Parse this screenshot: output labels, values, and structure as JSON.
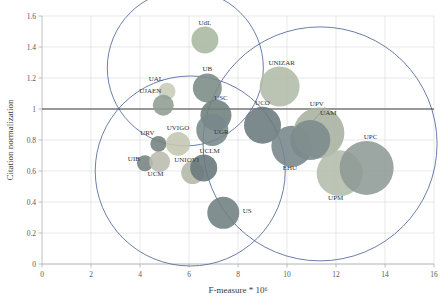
{
  "chart_data": {
    "type": "scatter",
    "title": "",
    "xlabel": "F-measure * 10⁶",
    "ylabel": "Citation normalization",
    "xlim": [
      0,
      16
    ],
    "ylim": [
      0,
      1.6
    ],
    "xticks": [
      0,
      2,
      4,
      6,
      8,
      10,
      12,
      14,
      16
    ],
    "yticks": [
      0,
      0.2,
      0.4,
      0.6,
      0.8,
      1,
      1.2,
      1.4,
      1.6
    ],
    "xtick_labels": [
      "0",
      "2",
      "4",
      "6",
      "8",
      "10",
      "12",
      "14",
      "16"
    ],
    "ytick_labels": [
      "0",
      "0.2",
      "0.4",
      "0.6",
      "0.8",
      "1",
      "1.2",
      "1.4",
      "1.6"
    ],
    "grid": true,
    "legend": "none",
    "reference_line": {
      "axis": "y",
      "value": 1.0,
      "color": "#3f3f3f"
    },
    "bubbles": [
      {
        "label": "UdL",
        "x": 6.65,
        "y": 1.445,
        "r": 13.5,
        "color": "#a9b7a0"
      },
      {
        "label": "UAL",
        "x": 5.1,
        "y": 1.115,
        "r": 8.5,
        "color": "#c8cbb8"
      },
      {
        "label": "UJAEN",
        "x": 4.95,
        "y": 1.025,
        "r": 10.5,
        "color": "#8f9d92"
      },
      {
        "label": "UB",
        "x": 6.75,
        "y": 1.135,
        "r": 14.5,
        "color": "#7b8b86"
      },
      {
        "label": "USC",
        "x": 7.1,
        "y": 0.96,
        "r": 15.5,
        "color": "#6f7f7c"
      },
      {
        "label": "UGR",
        "x": 6.95,
        "y": 0.865,
        "r": 16.0,
        "color": "#78878a"
      },
      {
        "label": "URV",
        "x": 4.75,
        "y": 0.775,
        "r": 8.0,
        "color": "#73817e"
      },
      {
        "label": "UVIGO",
        "x": 5.55,
        "y": 0.775,
        "r": 12.0,
        "color": "#c4c6b2"
      },
      {
        "label": "UIB",
        "x": 4.2,
        "y": 0.65,
        "r": 8.0,
        "color": "#74827f"
      },
      {
        "label": "UCM",
        "x": 4.8,
        "y": 0.66,
        "r": 10.5,
        "color": "#b9bcae"
      },
      {
        "label": "UNIOVI",
        "x": 6.15,
        "y": 0.59,
        "r": 11.5,
        "color": "#b3b7a6"
      },
      {
        "label": "UCLM",
        "x": 6.6,
        "y": 0.62,
        "r": 13.5,
        "color": "#68767a"
      },
      {
        "label": "US",
        "x": 7.4,
        "y": 0.33,
        "r": 16.0,
        "color": "#707f81"
      },
      {
        "label": "UNIZAR",
        "x": 9.7,
        "y": 1.145,
        "r": 20.0,
        "color": "#b2bca8"
      },
      {
        "label": "UCO",
        "x": 9.0,
        "y": 0.895,
        "r": 18.5,
        "color": "#6a797d"
      },
      {
        "label": "EHU",
        "x": 10.2,
        "y": 0.76,
        "r": 20.5,
        "color": "#76858a"
      },
      {
        "label": "UPV",
        "x": 11.3,
        "y": 0.845,
        "r": 25.5,
        "color": "#a6b19f"
      },
      {
        "label": "UAM",
        "x": 10.95,
        "y": 0.8,
        "r": 20.0,
        "color": "#7c8a8c"
      },
      {
        "label": "UPM",
        "x": 12.15,
        "y": 0.585,
        "r": 23.0,
        "color": "#b3bcab"
      },
      {
        "label": "UPC",
        "x": 13.25,
        "y": 0.62,
        "r": 27.0,
        "color": "#8e9a95"
      }
    ],
    "group_circles": [
      {
        "name": "cluster-top-left",
        "cx": 5.85,
        "cy": 1.265,
        "rx": 78.0,
        "ry": 78.0
      },
      {
        "name": "cluster-bottom-left",
        "cx": 6.05,
        "cy": 0.6,
        "rx": 95.0,
        "ry": 95.0
      },
      {
        "name": "cluster-right",
        "cx": 11.35,
        "cy": 0.775,
        "rx": 117.0,
        "ry": 117.0
      }
    ],
    "leader_lines": [
      {
        "from_label": "UAM",
        "x1": 11.55,
        "y1": 1.012,
        "x2": 10.98,
        "y2": 0.905
      }
    ]
  }
}
